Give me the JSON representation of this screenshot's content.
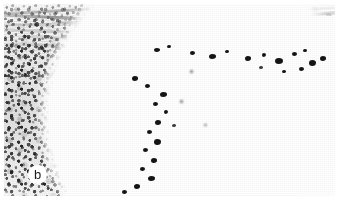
{
  "figure": {
    "type": "histology-micrograph",
    "panel_label": "b",
    "panel_label_shape": "circle",
    "alt": "Histopathology micrograph panel b: dense dark cellular infiltrate at left with wavy collagen fibre band across the top and a sharply demarcated curved interface against clear unstained space at lower right.",
    "width_px": 339,
    "height_px": 210
  },
  "regions": {
    "collagen_band": {
      "name": "collagen-fibre-band",
      "description": "Wavy pale striated fibrous bundles forming the upper band."
    },
    "infiltrate": {
      "name": "dense-cellular-infiltrate",
      "description": "Heavily nucleated dark cellular mass occupying the left and lower-left field."
    },
    "interface": {
      "name": "tissue-interface-curve",
      "description": "Sharp convex boundary separating the cellular mass from the clear space."
    },
    "clear_space": {
      "name": "clear-unstained-space",
      "description": "Empty white field at the right and lower-right of the section."
    }
  },
  "palette": {
    "background": "#ffffff",
    "nuclei_dark": "#141414",
    "nuclei_mid": "#3a3a3a",
    "fibre_gray": "#6f6f6f",
    "stroma_pale": "#c9c9c9",
    "label_text": "#1a1a1a",
    "label_disc": "#ffffff"
  }
}
